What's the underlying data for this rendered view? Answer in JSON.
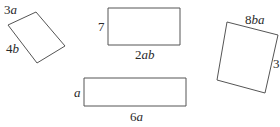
{
  "diagram": {
    "stroke_color": "#555555",
    "text_color": "#2a2a2a",
    "shapes": [
      {
        "id": "rotated-rectangle-left",
        "points": "8,25 36,12 65,46 37,63",
        "labels": [
          {
            "coef": "3",
            "var": "a",
            "x": 4,
            "y": 14
          },
          {
            "coef": "4",
            "var": "b",
            "x": 6,
            "y": 53
          }
        ]
      },
      {
        "id": "rectangle-top",
        "points": "108,8 180,8 180,45 108,45",
        "labels": [
          {
            "coef": "7",
            "var": "",
            "x": 98,
            "y": 31
          },
          {
            "coef": "2",
            "var": "ab",
            "x": 135,
            "y": 59
          }
        ]
      },
      {
        "id": "rotated-square-right",
        "points": "227,22 278,35 265,93 217,80",
        "labels": [
          {
            "coef": "8",
            "var": "ba",
            "x": 245,
            "y": 24
          },
          {
            "coef": "3",
            "var": "",
            "x": 273,
            "y": 68
          }
        ]
      },
      {
        "id": "rectangle-bottom",
        "points": "84,78 186,78 186,106 84,106",
        "labels": [
          {
            "coef": "",
            "var": "a",
            "x": 74,
            "y": 97
          },
          {
            "coef": "6",
            "var": "a",
            "x": 130,
            "y": 121
          }
        ]
      }
    ]
  }
}
